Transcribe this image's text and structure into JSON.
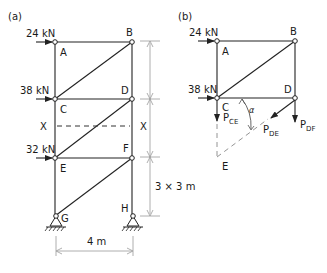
{
  "panel_a": {
    "label": "(a)",
    "loads": [
      {
        "node": "A",
        "value": "24 kN"
      },
      {
        "node": "C",
        "value": "38 kN"
      },
      {
        "node": "E",
        "value": "32 kN"
      }
    ],
    "nodes": [
      "A",
      "B",
      "C",
      "D",
      "E",
      "F",
      "G",
      "H"
    ],
    "section_labels": {
      "left": "X",
      "right": "X"
    },
    "dimensions": {
      "height": "3 × 3 m",
      "width": "4 m"
    }
  },
  "panel_b": {
    "label": "(b)",
    "loads": [
      {
        "node": "A",
        "value": "24 kN"
      },
      {
        "node": "C",
        "value": "38 kN"
      }
    ],
    "nodes": [
      "A",
      "B",
      "C",
      "D",
      "E"
    ],
    "angle_label": "α",
    "forces": [
      {
        "name": "P",
        "sub": "CE"
      },
      {
        "name": "P",
        "sub": "DE"
      },
      {
        "name": "P",
        "sub": "DF"
      }
    ]
  }
}
